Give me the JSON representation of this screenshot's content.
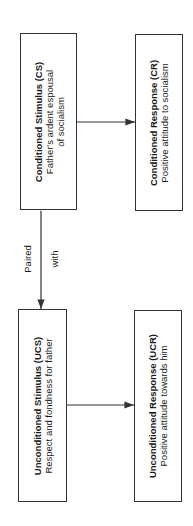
{
  "diagram": {
    "type": "classical-conditioning-flow",
    "orientation": "rotated -90deg",
    "nodes": {
      "cs": {
        "title": "Conditioned Stimulus (CS)",
        "desc_line1": "Father's ardent espousal",
        "desc_line2": "of socialism"
      },
      "cr": {
        "title": "Conditioned Response (CR)",
        "desc_line1": "Positive attitude to socialism"
      },
      "ucs": {
        "title": "Unconditioned Stimulus (UCS)",
        "desc_line1": "Respect and fondness for father"
      },
      "ucr": {
        "title": "Unconditioned Response (UCR)",
        "desc_line1": "Positive attitude towards him"
      }
    },
    "edges": [
      {
        "from": "cs",
        "to": "cr",
        "label": ""
      },
      {
        "from": "ucs",
        "to": "ucr",
        "label": ""
      },
      {
        "from": "cs",
        "to": "ucs",
        "label": "Paired with",
        "bidirectional": true
      }
    ],
    "paired_label_line1": "Paired",
    "paired_label_line2": "with"
  }
}
